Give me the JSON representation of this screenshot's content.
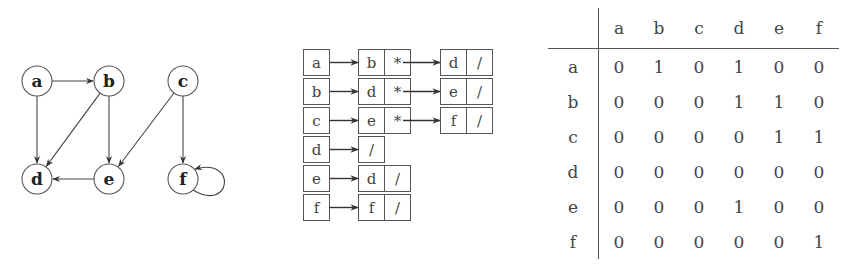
{
  "graph": {
    "nodes": [
      {
        "id": "a",
        "label": "a",
        "x": 37,
        "y": 81
      },
      {
        "id": "b",
        "label": "b",
        "x": 109,
        "y": 81
      },
      {
        "id": "c",
        "label": "c",
        "x": 183,
        "y": 81
      },
      {
        "id": "d",
        "label": "d",
        "x": 37,
        "y": 179
      },
      {
        "id": "e",
        "label": "e",
        "x": 109,
        "y": 179
      },
      {
        "id": "f",
        "label": "f",
        "x": 183,
        "y": 179
      }
    ],
    "edges": [
      {
        "from": "a",
        "to": "b"
      },
      {
        "from": "a",
        "to": "d"
      },
      {
        "from": "b",
        "to": "d"
      },
      {
        "from": "b",
        "to": "e"
      },
      {
        "from": "c",
        "to": "e"
      },
      {
        "from": "c",
        "to": "f"
      },
      {
        "from": "e",
        "to": "d"
      },
      {
        "from": "f",
        "to": "f"
      }
    ]
  },
  "adjacency_list": {
    "rows": [
      {
        "head": "a",
        "nodes": [
          {
            "value": "b",
            "next": "*"
          },
          {
            "value": "d",
            "next": "/"
          }
        ]
      },
      {
        "head": "b",
        "nodes": [
          {
            "value": "d",
            "next": "*"
          },
          {
            "value": "e",
            "next": "/"
          }
        ]
      },
      {
        "head": "c",
        "nodes": [
          {
            "value": "e",
            "next": "*"
          },
          {
            "value": "f",
            "next": "/"
          }
        ]
      },
      {
        "head": "d",
        "nodes": [],
        "null_marker": "/"
      },
      {
        "head": "e",
        "nodes": [
          {
            "value": "d",
            "next": "/"
          }
        ]
      },
      {
        "head": "f",
        "nodes": [
          {
            "value": "f",
            "next": "/"
          }
        ]
      }
    ]
  },
  "matrix": {
    "columns": [
      "a",
      "b",
      "c",
      "d",
      "e",
      "f"
    ],
    "rows": [
      {
        "label": "a",
        "values": [
          "0",
          "1",
          "0",
          "1",
          "0",
          "0"
        ]
      },
      {
        "label": "b",
        "values": [
          "0",
          "0",
          "0",
          "1",
          "1",
          "0"
        ]
      },
      {
        "label": "c",
        "values": [
          "0",
          "0",
          "0",
          "0",
          "1",
          "1"
        ]
      },
      {
        "label": "d",
        "values": [
          "0",
          "0",
          "0",
          "0",
          "0",
          "0"
        ]
      },
      {
        "label": "e",
        "values": [
          "0",
          "0",
          "0",
          "1",
          "0",
          "0"
        ]
      },
      {
        "label": "f",
        "values": [
          "0",
          "0",
          "0",
          "0",
          "0",
          "1"
        ]
      }
    ]
  }
}
